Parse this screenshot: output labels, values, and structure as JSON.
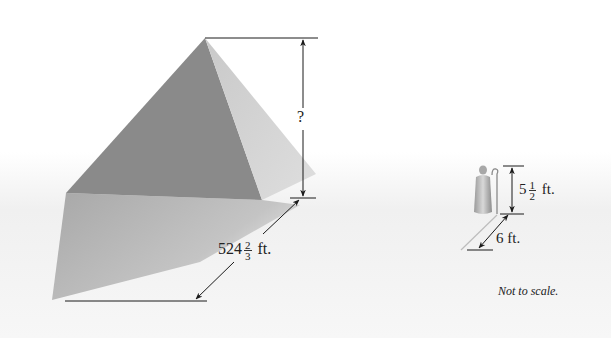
{
  "diagram": {
    "pyramid": {
      "height_label": "?",
      "base_label": {
        "whole": "524",
        "num": "2",
        "den": "3",
        "unit": "ft."
      }
    },
    "person": {
      "height_label": {
        "whole": "5",
        "num": "1",
        "den": "2",
        "unit": "ft."
      },
      "shadow_label": "6 ft."
    },
    "note": "Not to scale.",
    "colors": {
      "dark_face": "#8a8a8a",
      "light_face": "#cfcfcf",
      "shadow_face": "#b4b4b4",
      "ground": "#efefef",
      "line": "#1a1a1a"
    }
  }
}
